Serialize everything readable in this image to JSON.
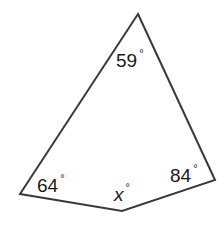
{
  "figure": {
    "type": "quadrilateral",
    "stroke_color": "#3a3a3a",
    "stroke_width": 2,
    "vertices": {
      "top": [
        138,
        14
      ],
      "right": [
        215,
        180
      ],
      "bottom": [
        122,
        211
      ],
      "left": [
        20,
        194
      ]
    },
    "points": "138,14 215,180 122,211 20,194"
  },
  "angles": {
    "top": {
      "value": "59",
      "unit": "°"
    },
    "left": {
      "value": "64",
      "unit": "°"
    },
    "bottom": {
      "value": "x",
      "unit": "°"
    },
    "right": {
      "value": "84",
      "unit": "°"
    }
  }
}
